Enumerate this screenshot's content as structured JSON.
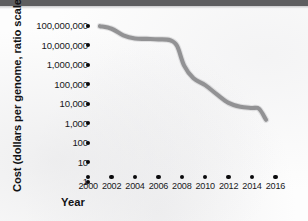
{
  "figure": {
    "scan_bar_color": "#5e5e60",
    "background_color": "#fdfdfd",
    "series_color": "#8c8c8e",
    "tick_color": "#0a0a0c"
  },
  "chart_data": {
    "type": "line",
    "title": "",
    "xlabel": "Year",
    "ylabel": "Cost (dollars per genome, ratio scale)",
    "scale": "log",
    "grid": false,
    "legend": false,
    "xlim": [
      2000,
      2016
    ],
    "ylim": [
      1,
      100000000
    ],
    "x_tick_labels": [
      "2000",
      "2002",
      "2004",
      "2006",
      "2008",
      "2010",
      "2012",
      "2014",
      "2016"
    ],
    "x_tick_values": [
      2000,
      2002,
      2004,
      2006,
      2008,
      2010,
      2012,
      2014,
      2016
    ],
    "y_tick_labels": [
      "100,000,000",
      "10,000,000",
      "1,000,000",
      "100,000",
      "10,000",
      "1,000",
      "100",
      "10",
      "1"
    ],
    "y_tick_values": [
      100000000,
      10000000,
      1000000,
      100000,
      10000,
      1000,
      100,
      10,
      1
    ],
    "series": [
      {
        "name": "Cost per genome",
        "x": [
          2001.0,
          2002.0,
          2003.0,
          2004.0,
          2005.0,
          2006.0,
          2007.0,
          2007.6,
          2008.2,
          2009.0,
          2010.0,
          2011.0,
          2012.0,
          2013.0,
          2014.0,
          2014.6,
          2015.2
        ],
        "values": [
          95000000,
          70000000,
          32000000,
          22000000,
          21000000,
          20000000,
          18000000,
          9000000,
          900000,
          200000,
          90000,
          30000,
          11000,
          7000,
          6000,
          5500,
          1500
        ]
      }
    ]
  }
}
